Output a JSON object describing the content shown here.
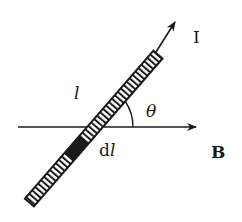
{
  "diagram": {
    "labels": {
      "current": "I",
      "length": "l",
      "element": "dl",
      "element_d": "d",
      "element_l": "l",
      "angle": "θ",
      "field": "B"
    },
    "colors": {
      "ink": "#1a1a1a",
      "background": "#ffffff"
    }
  }
}
